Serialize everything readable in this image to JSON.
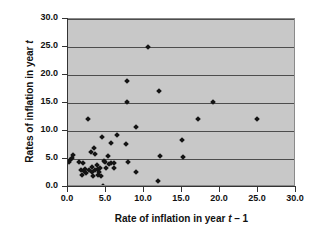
{
  "chart_data": {
    "type": "scatter",
    "title": "",
    "xlabel": "Rate of inflation in year t – 1",
    "ylabel": "Rates of inflation in year t",
    "xlim": [
      0,
      30
    ],
    "ylim": [
      0,
      30
    ],
    "xticks": [
      "0.0",
      "5.0",
      "10.0",
      "15.0",
      "20.0",
      "25.0",
      "30.0"
    ],
    "yticks": [
      "0.0",
      "5.0",
      "10.0",
      "15.0",
      "20.0",
      "25.0",
      "30.0"
    ],
    "xtick_values": [
      0,
      5,
      10,
      15,
      20,
      25,
      30
    ],
    "ytick_values": [
      0,
      5,
      10,
      15,
      20,
      25,
      30
    ],
    "grid": "horizontal",
    "legend": "none",
    "plot_background": "#c8c8c8",
    "marker_color": "#141414",
    "marker_shape": "diamond",
    "points": [
      [
        0.1,
        4.4
      ],
      [
        0.2,
        4.8
      ],
      [
        0.5,
        5.1
      ],
      [
        0.7,
        5.7
      ],
      [
        1.5,
        4.4
      ],
      [
        1.7,
        3.0
      ],
      [
        1.8,
        2.2
      ],
      [
        2.0,
        4.3
      ],
      [
        2.1,
        2.8
      ],
      [
        2.3,
        3.3
      ],
      [
        2.4,
        2.5
      ],
      [
        2.6,
        12.1
      ],
      [
        2.8,
        3.0
      ],
      [
        3.0,
        6.2
      ],
      [
        3.1,
        3.5
      ],
      [
        3.2,
        2.6
      ],
      [
        3.3,
        1.9
      ],
      [
        3.4,
        6.9
      ],
      [
        3.5,
        5.9
      ],
      [
        3.6,
        3.1
      ],
      [
        3.8,
        4.0
      ],
      [
        3.9,
        2.1
      ],
      [
        4.0,
        3.3
      ],
      [
        4.1,
        2.7
      ],
      [
        4.2,
        3.4
      ],
      [
        4.4,
        1.9
      ],
      [
        4.5,
        8.9
      ],
      [
        4.6,
        0.1
      ],
      [
        4.7,
        4.6
      ],
      [
        4.9,
        4.4
      ],
      [
        5.0,
        3.4
      ],
      [
        5.2,
        5.6
      ],
      [
        5.4,
        4.1
      ],
      [
        5.6,
        4.3
      ],
      [
        5.7,
        7.9
      ],
      [
        6.0,
        4.3
      ],
      [
        6.1,
        3.4
      ],
      [
        6.4,
        9.3
      ],
      [
        7.6,
        7.7
      ],
      [
        7.7,
        19.0
      ],
      [
        7.8,
        15.1
      ],
      [
        7.9,
        4.5
      ],
      [
        8.9,
        10.7
      ],
      [
        9.0,
        2.7
      ],
      [
        10.5,
        25.0
      ],
      [
        11.8,
        1.1
      ],
      [
        12.0,
        17.2
      ],
      [
        12.1,
        5.5
      ],
      [
        15.0,
        8.4
      ],
      [
        15.1,
        5.3
      ],
      [
        17.1,
        12.1
      ],
      [
        19.1,
        15.1
      ],
      [
        24.9,
        12.1
      ]
    ]
  }
}
